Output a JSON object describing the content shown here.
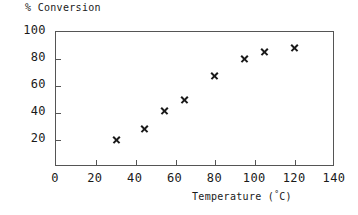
{
  "chart_data": {
    "type": "scatter",
    "title": "",
    "xlabel": "Temperature (°C)",
    "ylabel": "% Conversion",
    "xlim": [
      0,
      140
    ],
    "ylim": [
      0,
      100
    ],
    "xticks": [
      "0",
      "20",
      "40",
      "60",
      "80",
      "100",
      "120",
      "140"
    ],
    "xtick_values": [
      0,
      20,
      40,
      60,
      80,
      100,
      120,
      140
    ],
    "yticks": [
      "20",
      "40",
      "60",
      "80",
      "100"
    ],
    "ytick_values": [
      20,
      40,
      60,
      80,
      100
    ],
    "grid": false,
    "legend": null,
    "marker": "x",
    "marker_color": "#1a1a1a",
    "x": [
      31,
      45,
      55,
      65,
      80,
      95,
      105,
      120
    ],
    "y": [
      20,
      28,
      41,
      49,
      67,
      80,
      85,
      88
    ],
    "points": [
      {
        "x": 31,
        "y": 20
      },
      {
        "x": 45,
        "y": 28
      },
      {
        "x": 55,
        "y": 41
      },
      {
        "x": 65,
        "y": 49
      },
      {
        "x": 80,
        "y": 67
      },
      {
        "x": 95,
        "y": 80
      },
      {
        "x": 105,
        "y": 85
      },
      {
        "x": 120,
        "y": 88
      }
    ]
  },
  "axis_labels": {
    "y_caption": "% Conversion",
    "x_caption_text": "Temperature (",
    "x_caption_degree": "°",
    "x_caption_unit": "C)"
  }
}
